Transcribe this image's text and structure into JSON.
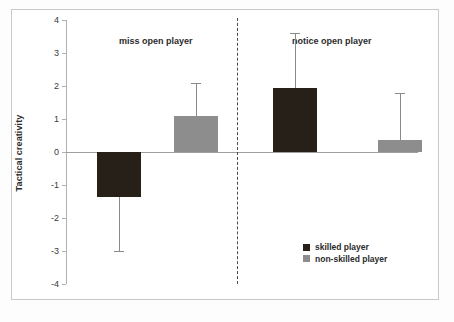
{
  "chart_data": {
    "type": "bar",
    "title": "",
    "subtitle": "",
    "xlabel": "",
    "ylabel": "Tactical creativity",
    "ylim": [
      -4,
      4
    ],
    "ytick_labels": [
      "4",
      "3",
      "2",
      "1",
      "0",
      "-1",
      "-2",
      "-3",
      "-4"
    ],
    "ytick_values": [
      4,
      3,
      2,
      1,
      0,
      -1,
      -2,
      -3,
      -4
    ],
    "grid": false,
    "legend_position": "bottom-right",
    "categories": [
      "miss open player",
      "notice open player"
    ],
    "series": [
      {
        "name": "skilled player",
        "color": "#262018",
        "values": [
          -1.35,
          1.95
        ],
        "error_upper": [
          0.0,
          1.65
        ],
        "error_lower": [
          1.65,
          0.0
        ],
        "error_extent": [
          -3.0,
          3.6
        ]
      },
      {
        "name": "non-skilled player",
        "color": "#8d8d8d",
        "values": [
          1.1,
          0.35
        ],
        "error_upper": [
          1.0,
          1.45
        ],
        "error_lower": [
          0.0,
          0.0
        ],
        "error_extent": [
          2.1,
          1.8
        ]
      }
    ],
    "annotations": [
      {
        "text": "miss open player",
        "x_frac": 0.255,
        "y_value": 3.35
      },
      {
        "text": "notice open player",
        "x_frac": 0.755,
        "y_value": 3.35
      }
    ],
    "divider": {
      "type": "dashed-vertical",
      "x_frac": 0.486
    }
  },
  "legend": {
    "items": [
      {
        "label": "skilled player",
        "swatch": "skilled"
      },
      {
        "label": "non-skilled player",
        "swatch": "nonskilled"
      }
    ]
  }
}
